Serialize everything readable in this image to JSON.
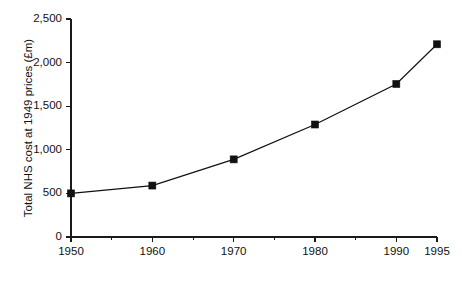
{
  "chart_data": {
    "type": "line",
    "title": "",
    "subtitle": "",
    "xlabel": "",
    "ylabel": "Total NHS cost at 1949 prices (£m)",
    "x": [
      1950,
      1960,
      1970,
      1980,
      1990,
      1995
    ],
    "values": [
      500,
      590,
      890,
      1290,
      1755,
      2210
    ],
    "series": [
      {
        "name": "Total NHS cost at 1949 prices",
        "values": [
          500,
          590,
          890,
          1290,
          1755,
          2210
        ]
      }
    ],
    "xlim": [
      1950,
      1995
    ],
    "ylim": [
      0,
      2500
    ],
    "grid": false,
    "legend": false,
    "legend_position": "none",
    "marker": "filled-square",
    "line_color": "#111111",
    "marker_color": "#111111",
    "background_color": "#ffffff",
    "x_tick_labels": [
      "1950",
      "1960",
      "1970",
      "1980",
      "1990",
      "1995"
    ],
    "x_tick_values": [
      1950,
      1960,
      1970,
      1980,
      1990,
      1995
    ],
    "x_minor_tick_values": [
      1955,
      1965,
      1975,
      1985
    ],
    "y_tick_labels": [
      "0",
      "500",
      "1,000",
      "1,500",
      "2,000",
      "2,500"
    ],
    "y_tick_values": [
      0,
      500,
      1000,
      1500,
      2000,
      2500
    ],
    "annotations": []
  }
}
